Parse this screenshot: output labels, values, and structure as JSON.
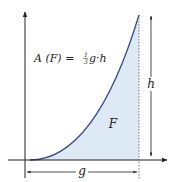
{
  "diagram": {
    "formula": {
      "lhs": "A (F) = ",
      "frac_num": "1",
      "frac_den": "3",
      "rhs": "g·h"
    },
    "region_label": "F",
    "width_label": "g",
    "height_label": "h",
    "colors": {
      "curve": "#3b4a8c",
      "fill": "#dde9f5",
      "axis": "#222222",
      "dotted": "#555555"
    }
  }
}
